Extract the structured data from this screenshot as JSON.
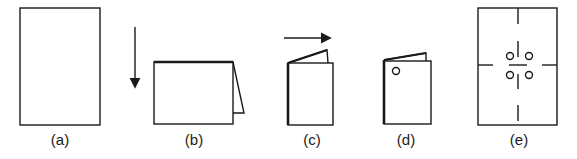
{
  "figure": {
    "panels": [
      {
        "id": "a",
        "label": "(a)",
        "caption_x": 40
      },
      {
        "id": "b",
        "label": "(b)",
        "caption_x": 174
      },
      {
        "id": "c",
        "label": "(c)",
        "caption_x": 292
      },
      {
        "id": "d",
        "label": "(d)",
        "caption_x": 386
      },
      {
        "id": "e",
        "label": "(e)",
        "caption_x": 499
      }
    ],
    "colors": {
      "stroke": "#1a1a1a",
      "background": "#ffffff"
    }
  }
}
